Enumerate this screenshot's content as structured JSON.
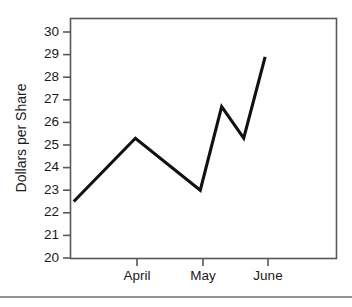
{
  "figure": {
    "background_color": "#ffffff",
    "line_color": "#111111",
    "frame_color": "#57585a",
    "rule_color": "#6e6f71"
  },
  "chart_data": {
    "type": "line",
    "title": "",
    "xlabel": "",
    "ylabel": "Dollars per Share",
    "ylim": [
      20,
      30.7
    ],
    "xlim": [
      0,
      4.1
    ],
    "grid": false,
    "legend": false,
    "y_ticks": [
      20,
      21,
      22,
      23,
      24,
      25,
      26,
      27,
      28,
      29,
      30
    ],
    "y_tick_labels": [
      "20",
      "21",
      "22",
      "23",
      "24",
      "25",
      "26",
      "27",
      "28",
      "29",
      "30"
    ],
    "x_ticks": [
      1,
      2,
      3
    ],
    "x_tick_labels": [
      "April",
      "May",
      "June"
    ],
    "categories": [
      "April",
      "May",
      "June"
    ],
    "series": [
      {
        "name": "Dollars per Share",
        "x": [
          0.05,
          1.0,
          2.0,
          2.33,
          2.67,
          3.0
        ],
        "values": [
          22.5,
          25.3,
          23.0,
          26.7,
          25.3,
          28.9
        ]
      }
    ],
    "points": [
      {
        "x": 0.05,
        "y": 22.5
      },
      {
        "x": 1.0,
        "y": 25.3
      },
      {
        "x": 2.0,
        "y": 23.0
      },
      {
        "x": 2.33,
        "y": 26.7
      },
      {
        "x": 2.67,
        "y": 25.3
      },
      {
        "x": 3.0,
        "y": 28.9
      }
    ]
  }
}
